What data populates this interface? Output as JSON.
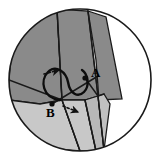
{
  "figure": {
    "canvas": {
      "width": 160,
      "height": 161,
      "background": "#ffffff"
    },
    "circle": {
      "name": "bounding-circle",
      "cx": 80,
      "cy": 80,
      "r": 71,
      "stroke": "#1a1a1a",
      "stroke_width": 1.6,
      "fill": "#ffffff"
    },
    "colors": {
      "dark_gray": "#8a8a8a",
      "mid_gray": "#a8a8a8",
      "light_gray": "#c8c8c8",
      "pale_gray": "#d8d8d8",
      "white": "#ffffff",
      "outline": "#1a1a1a",
      "label": "#000000"
    },
    "regions": [
      {
        "name": "upper-left-dark-sector",
        "fill": "#8a8a8a",
        "points": "9,80 11,58 18,40 30,24 45,13 57,9 62,100 40,104 9,100"
      },
      {
        "name": "upper-dark-band",
        "fill": "#8a8a8a",
        "points": "57,9 88,11 98,96 85,100 62,100"
      },
      {
        "name": "upper-right-dark-wing",
        "fill": "#8a8a8a",
        "points": "88,11 106,17 122,99 99,100 96,60"
      },
      {
        "name": "lower-left-light-sector",
        "fill": "#c8c8c8",
        "points": "9,100 40,104 62,100 80,151 56,149 34,138 18,122 11,111"
      },
      {
        "name": "lower-mid-light-wedge",
        "fill": "#c8c8c8",
        "points": "62,100 85,100 96,151 80,151"
      },
      {
        "name": "lower-right-narrow-wedge",
        "fill": "#b8b8b8",
        "points": "85,100 98,96 104,150 96,151"
      },
      {
        "name": "right-tab-wedge",
        "fill": "#c0c0c0",
        "points": "98,96 104,94 110,104 104,150"
      }
    ],
    "fold_lines": [
      {
        "name": "fold-line-left-radial",
        "x1": 9,
        "y1": 80,
        "x2": 62,
        "y2": 100
      },
      {
        "name": "fold-line-upper-left",
        "x1": 57,
        "y1": 9,
        "x2": 62,
        "y2": 100
      },
      {
        "name": "fold-line-upper-right",
        "x1": 88,
        "y1": 11,
        "x2": 98,
        "y2": 96
      },
      {
        "name": "fold-line-lower-left",
        "x1": 62,
        "y1": 100,
        "x2": 80,
        "y2": 151
      },
      {
        "name": "fold-line-lower-mid",
        "x1": 85,
        "y1": 100,
        "x2": 96,
        "y2": 151
      },
      {
        "name": "fold-line-lower-right",
        "x1": 98,
        "y1": 96,
        "x2": 104,
        "y2": 150
      },
      {
        "name": "fold-line-diagonal-AB",
        "x1": 52,
        "y1": 104,
        "x2": 98,
        "y2": 76
      },
      {
        "name": "fold-line-crease-A",
        "x1": 85,
        "y1": 78,
        "x2": 98,
        "y2": 96
      },
      {
        "name": "fold-line-crease-tab",
        "x1": 98,
        "y1": 96,
        "x2": 104,
        "y2": 94
      }
    ],
    "curve": {
      "name": "rotation-swoosh-curve",
      "path": "M 60,100 C 42,98 40,80 48,72 C 56,64 66,72 68,82 C 70,94 78,98 84,92 C 90,86 88,74 82,70",
      "stroke": "#0d0d0d",
      "stroke_width": 2.4
    },
    "points": [
      {
        "name": "point-A",
        "label": "A",
        "cx": 85,
        "cy": 78,
        "label_x": 91,
        "label_y": 77,
        "r": 2.6
      },
      {
        "name": "point-B",
        "label": "B",
        "cx": 52,
        "cy": 104,
        "label_x": 46,
        "label_y": 117,
        "r": 2.6
      }
    ],
    "dashed_arrows": [
      {
        "name": "dashed-arrow-upper-left",
        "x1": 44,
        "y1": 74,
        "x2": 59,
        "y2": 70,
        "stroke": "#111111",
        "dash": "2.2 2.2"
      },
      {
        "name": "dashed-arrow-lower-right",
        "x1": 63,
        "y1": 106,
        "x2": 78,
        "y2": 112,
        "stroke": "#111111",
        "dash": "2.2 2.2"
      }
    ],
    "labels": {
      "point_a": "A",
      "point_b": "B"
    }
  }
}
